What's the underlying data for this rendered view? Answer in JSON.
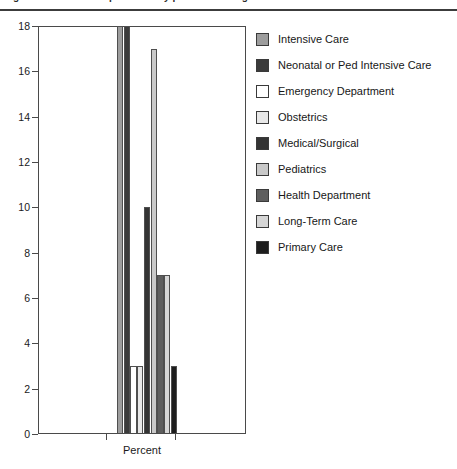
{
  "figure": {
    "top_caption_clipped": "Figure. Percent of respondents by practice setting",
    "x_axis_label": "Percent",
    "y_axis_label": ""
  },
  "chart_data": {
    "type": "bar",
    "title": "",
    "xlabel": "Percent",
    "ylabel": "",
    "ylim": [
      0,
      18
    ],
    "yticks": [
      0,
      2,
      4,
      6,
      8,
      10,
      12,
      14,
      16,
      18
    ],
    "grid": false,
    "legend_position": "right",
    "categories": [
      "Intensive Care",
      "Neonatal or Ped Intensive Care",
      "Emergency Department",
      "Obstetrics",
      "Medical/Surgical",
      "Pediatrics",
      "Health Department",
      "Long-Term Care",
      "Primary Care"
    ],
    "values": [
      18,
      18,
      3,
      3,
      10,
      17,
      7,
      7,
      3
    ],
    "colors": [
      "#9d9d9d",
      "#3b3b3b",
      "#ffffff",
      "#e8e8e8",
      "#343434",
      "#c9c9c9",
      "#5e5e5e",
      "#d6d6d6",
      "#1d1d1d"
    ]
  },
  "legend": {
    "items": [
      {
        "label": "Intensive Care",
        "color": "#9d9d9d"
      },
      {
        "label": "Neonatal or Ped Intensive Care",
        "color": "#3b3b3b"
      },
      {
        "label": "Emergency Department",
        "color": "#ffffff"
      },
      {
        "label": "Obstetrics",
        "color": "#e8e8e8"
      },
      {
        "label": "Medical/Surgical",
        "color": "#343434"
      },
      {
        "label": "Pediatrics",
        "color": "#c9c9c9"
      },
      {
        "label": "Health Department",
        "color": "#5e5e5e"
      },
      {
        "label": "Long-Term Care",
        "color": "#d6d6d6"
      },
      {
        "label": "Primary Care",
        "color": "#1d1d1d"
      }
    ]
  },
  "axis": {
    "y_tick_labels": [
      "18",
      "16",
      "14",
      "12",
      "10",
      "8",
      "6",
      "4",
      "2",
      "0"
    ]
  }
}
